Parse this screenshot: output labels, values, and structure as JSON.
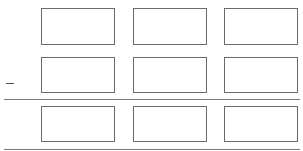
{
  "grid": {
    "rows": [
      {
        "cells": [
          {
            "value": ""
          },
          {
            "value": ""
          },
          {
            "value": ""
          }
        ],
        "marker": ""
      },
      {
        "cells": [
          {
            "value": ""
          },
          {
            "value": ""
          },
          {
            "value": ""
          }
        ],
        "marker": "–"
      },
      {
        "cells": [
          {
            "value": ""
          },
          {
            "value": ""
          },
          {
            "value": ""
          }
        ],
        "marker": ""
      }
    ]
  },
  "colors": {
    "border": "#6a6a6a",
    "divider": "#7a7a7a",
    "background": "#ffffff"
  }
}
